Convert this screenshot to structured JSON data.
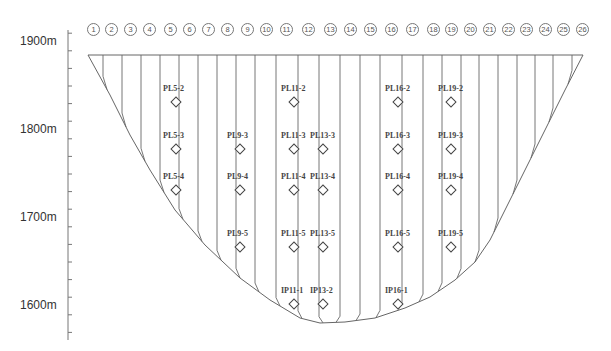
{
  "y_axis": {
    "labels": [
      {
        "text": "1900m",
        "elevation": 1900
      },
      {
        "text": "1800m",
        "elevation": 1800
      },
      {
        "text": "1700m",
        "elevation": 1700
      },
      {
        "text": "1600m",
        "elevation": 1600
      }
    ]
  },
  "joints": [
    "1",
    "2",
    "3",
    "4",
    "5",
    "6",
    "7",
    "8",
    "9",
    "10",
    "11",
    "12",
    "13",
    "14",
    "15",
    "16",
    "17",
    "18",
    "19",
    "20",
    "21",
    "22",
    "23",
    "24",
    "25",
    "26"
  ],
  "instruments": [
    {
      "label": "PL5-2",
      "joint": 5,
      "row": 1
    },
    {
      "label": "PL5-3",
      "joint": 5,
      "row": 2
    },
    {
      "label": "PL5-4",
      "joint": 5,
      "row": 3
    },
    {
      "label": "PL9-3",
      "joint": 9,
      "row": 2
    },
    {
      "label": "PL9-4",
      "joint": 9,
      "row": 3
    },
    {
      "label": "PL9-5",
      "joint": 9,
      "row": 4
    },
    {
      "label": "PL11-2",
      "joint": 11,
      "row": 1
    },
    {
      "label": "PL11-3",
      "joint": 11,
      "row": 2
    },
    {
      "label": "PL11-4",
      "joint": 11,
      "row": 3
    },
    {
      "label": "PL11-5",
      "joint": 11,
      "row": 4
    },
    {
      "label": "IP11-1",
      "joint": 11,
      "row": 5
    },
    {
      "label": "PL13-3",
      "joint": 13,
      "row": 2
    },
    {
      "label": "PL13-4",
      "joint": 13,
      "row": 3
    },
    {
      "label": "PL13-5",
      "joint": 13,
      "row": 4
    },
    {
      "label": "IP13-2",
      "joint": 13,
      "row": 5
    },
    {
      "label": "PL16-2",
      "joint": 16,
      "row": 1
    },
    {
      "label": "PL16-3",
      "joint": 16,
      "row": 2
    },
    {
      "label": "PL16-4",
      "joint": 16,
      "row": 3
    },
    {
      "label": "PL16-5",
      "joint": 16,
      "row": 4
    },
    {
      "label": "IP16-1",
      "joint": 16,
      "row": 5
    },
    {
      "label": "PL19-2",
      "joint": 19,
      "row": 1
    },
    {
      "label": "PL19-3",
      "joint": 19,
      "row": 2
    },
    {
      "label": "PL19-4",
      "joint": 19,
      "row": 3
    },
    {
      "label": "PL19-5",
      "joint": 19,
      "row": 4
    }
  ],
  "colors": {
    "line": "#666666",
    "text": "#333333",
    "background": "#ffffff"
  }
}
